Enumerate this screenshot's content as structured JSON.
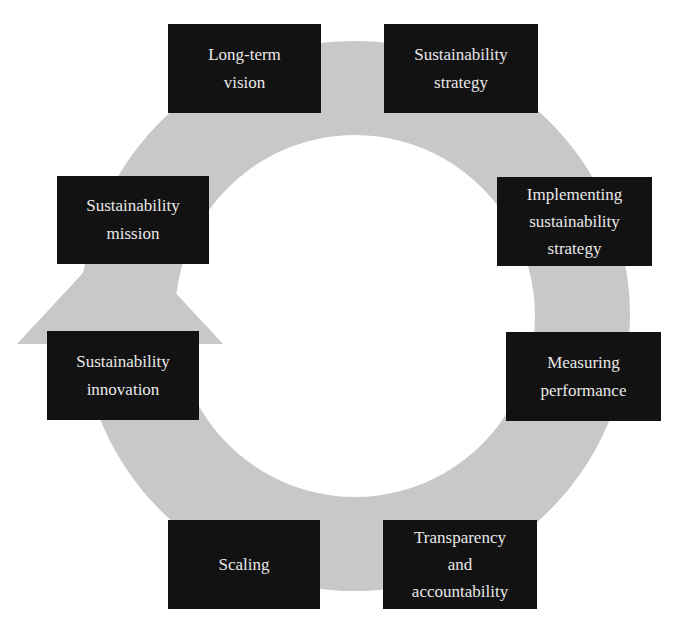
{
  "diagram": {
    "type": "cycle",
    "colors": {
      "background": "#ffffff",
      "ring": "#c8c8c8",
      "box_fill": "#121212",
      "box_text": "#e8e8e8"
    },
    "direction": "clockwise, arrowhead on left side pointing up",
    "steps": [
      {
        "id": "long-term-vision",
        "lines": [
          "Long-term",
          "vision"
        ]
      },
      {
        "id": "sustainability-strategy",
        "lines": [
          "Sustainability",
          "strategy"
        ]
      },
      {
        "id": "implementing-sustainability-strategy",
        "lines": [
          "Implementing",
          "sustainability",
          "strategy"
        ]
      },
      {
        "id": "measuring-performance",
        "lines": [
          "Measuring",
          "performance"
        ]
      },
      {
        "id": "transparency-and-accountability",
        "lines": [
          "Transparency",
          "and",
          "accountability"
        ]
      },
      {
        "id": "scaling",
        "lines": [
          "Scaling"
        ]
      },
      {
        "id": "sustainability-innovation",
        "lines": [
          "Sustainability",
          "innovation"
        ]
      },
      {
        "id": "sustainability-mission",
        "lines": [
          "Sustainability",
          "mission"
        ]
      }
    ]
  }
}
